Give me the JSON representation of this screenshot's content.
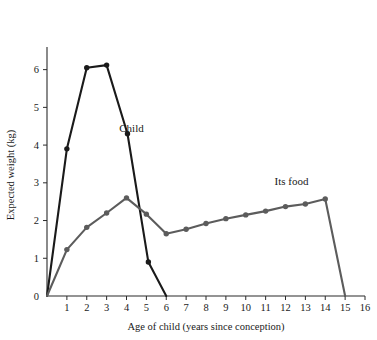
{
  "chart_data": {
    "type": "line",
    "title": "",
    "xlabel": "Age of child (years since conception)",
    "ylabel": "Expected weight (kg)",
    "xlim": [
      0,
      16
    ],
    "ylim": [
      0,
      6.6
    ],
    "xticks": [
      0,
      1,
      2,
      3,
      4,
      5,
      6,
      7,
      8,
      9,
      10,
      11,
      12,
      13,
      14,
      15,
      16
    ],
    "xticklabels": [
      "0",
      "1",
      "2",
      "3",
      "4",
      "5",
      "6",
      "7",
      "8",
      "9",
      "10",
      "11",
      "12",
      "13",
      "14",
      "15",
      "16"
    ],
    "yticks": [
      0,
      1,
      2,
      3,
      4,
      5,
      6
    ],
    "yticklabels": [
      "0",
      "1",
      "2",
      "3",
      "4",
      "5",
      "6"
    ],
    "grid": false,
    "legend_position": "inline-annotation",
    "series": [
      {
        "name": "Child",
        "color": "#1a1a1a",
        "label_text": "Child",
        "label_x": 4.25,
        "label_y": 4.35,
        "markers": true,
        "points": [
          {
            "x": 0,
            "y": 0
          },
          {
            "x": 1,
            "y": 3.9
          },
          {
            "x": 2,
            "y": 6.05
          },
          {
            "x": 3,
            "y": 6.12
          },
          {
            "x": 4.05,
            "y": 4.3
          },
          {
            "x": 5.1,
            "y": 0.9
          },
          {
            "x": 6,
            "y": 0
          }
        ]
      },
      {
        "name": "Its food",
        "color": "#5c5c5c",
        "label_text": "Its food",
        "label_x": 12.3,
        "label_y": 2.95,
        "markers": true,
        "points": [
          {
            "x": 0,
            "y": 0
          },
          {
            "x": 1,
            "y": 1.23
          },
          {
            "x": 2,
            "y": 1.82
          },
          {
            "x": 3,
            "y": 2.2
          },
          {
            "x": 4,
            "y": 2.6
          },
          {
            "x": 5,
            "y": 2.17
          },
          {
            "x": 6,
            "y": 1.65
          },
          {
            "x": 7,
            "y": 1.77
          },
          {
            "x": 8,
            "y": 1.92
          },
          {
            "x": 9,
            "y": 2.05
          },
          {
            "x": 10,
            "y": 2.15
          },
          {
            "x": 11,
            "y": 2.25
          },
          {
            "x": 12,
            "y": 2.37
          },
          {
            "x": 13,
            "y": 2.44
          },
          {
            "x": 14,
            "y": 2.57
          },
          {
            "x": 15,
            "y": 0
          }
        ]
      }
    ]
  }
}
